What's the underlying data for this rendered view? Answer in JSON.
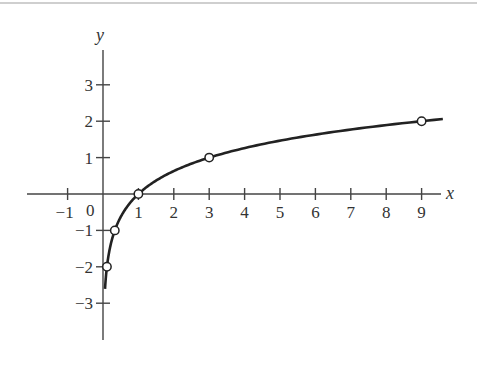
{
  "chart_data": {
    "type": "line",
    "title": "",
    "function": "y = log_3(x)",
    "xlabel": "x",
    "ylabel": "y",
    "xlim": [
      -2.1,
      9.7
    ],
    "ylim": [
      -4.0,
      4.3
    ],
    "grid": false,
    "legend": null,
    "x_ticks": [
      -1,
      1,
      2,
      3,
      4,
      5,
      6,
      7,
      8,
      9
    ],
    "x_tick_labels": [
      "−1",
      "1",
      "2",
      "3",
      "4",
      "5",
      "6",
      "7",
      "8",
      "9"
    ],
    "y_ticks": [
      3,
      2,
      1,
      -1,
      -2,
      -3
    ],
    "y_tick_labels": [
      "3",
      "2",
      "1",
      "−1",
      "−2",
      "−3"
    ],
    "origin_label": "0",
    "marked_points": [
      {
        "x": 0.1111,
        "y": -2,
        "label": "(1/9, -2)"
      },
      {
        "x": 0.3333,
        "y": -1,
        "label": "(1/3, -1)"
      },
      {
        "x": 1,
        "y": 0,
        "label": "(1, 0)"
      },
      {
        "x": 3,
        "y": 1,
        "label": "(3, 1)"
      },
      {
        "x": 9,
        "y": 2,
        "label": "(9, 2)"
      }
    ],
    "curve_domain": [
      0.057,
      9.6
    ],
    "series": [
      {
        "name": "log3(x)",
        "x": [
          0.057,
          0.1111,
          0.2,
          0.3333,
          0.5,
          0.75,
          1,
          1.5,
          2,
          3,
          4,
          5,
          6,
          7,
          8,
          9,
          9.6
        ],
        "y": [
          -2.6,
          -2,
          -1.465,
          -1,
          -0.631,
          -0.262,
          0,
          0.369,
          0.631,
          1,
          1.262,
          1.465,
          1.631,
          1.771,
          1.893,
          2,
          2.059
        ]
      }
    ]
  },
  "colors": {
    "axis": "#444444",
    "curve": "#222222",
    "marker_fill": "#ffffff",
    "text": "#333333"
  }
}
